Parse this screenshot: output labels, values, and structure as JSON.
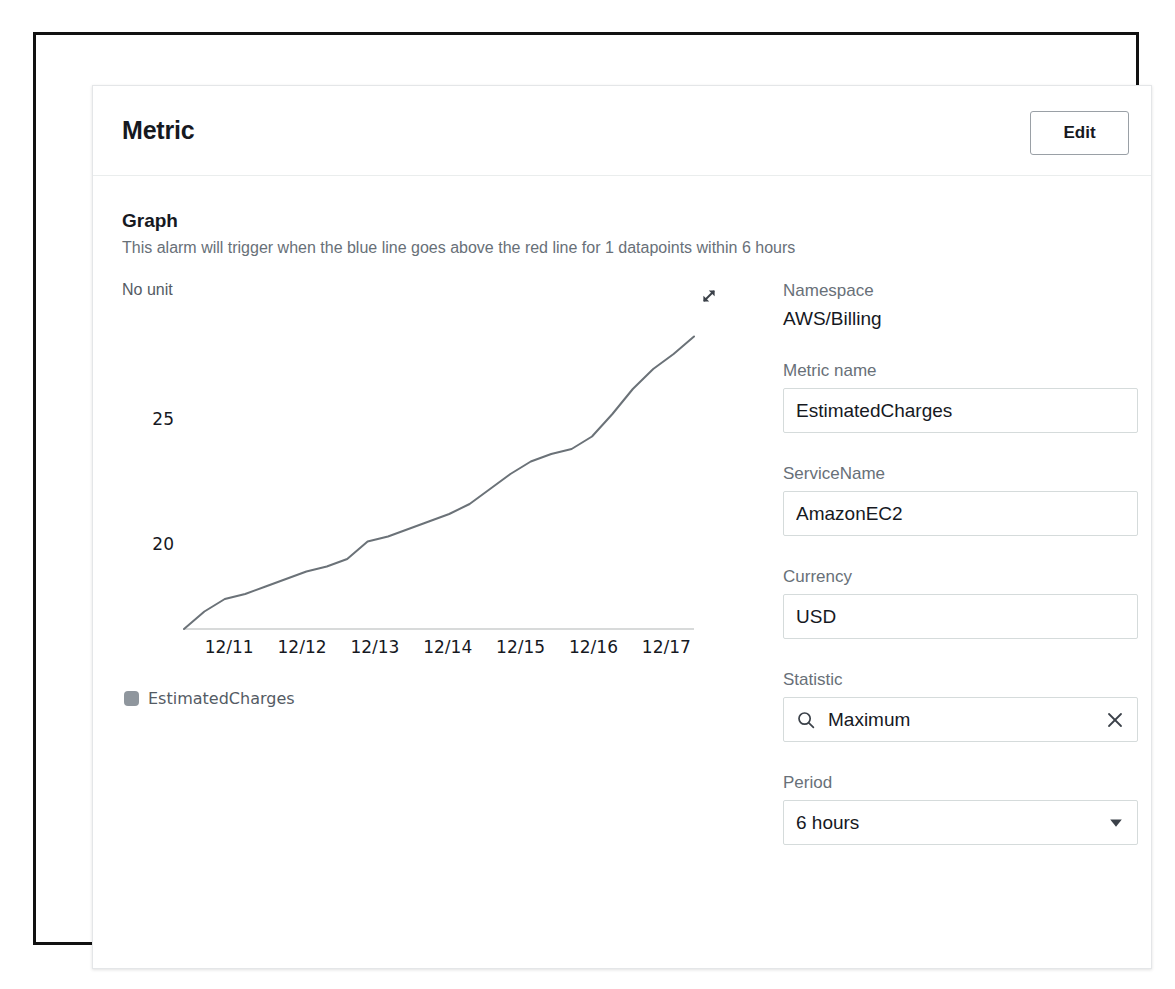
{
  "card": {
    "title": "Metric",
    "edit_label": "Edit"
  },
  "graph_section": {
    "heading": "Graph",
    "description": "This alarm will trigger when the blue line goes above the red line for 1 datapoints within 6 hours",
    "expand_icon": "expand-arrows-icon"
  },
  "chart_data": {
    "type": "line",
    "title": "",
    "unit_label": "No unit",
    "xlabel": "",
    "ylabel": "",
    "grid": false,
    "legend_position": "bottom-left",
    "categories": [
      "12/11",
      "12/12",
      "12/13",
      "12/14",
      "12/15",
      "12/16",
      "12/17"
    ],
    "tick_labels_y": [
      "20",
      "25"
    ],
    "ytick_values": [
      20,
      25
    ],
    "ylim": [
      16.6,
      29.4
    ],
    "series": [
      {
        "name": "EstimatedCharges",
        "color": "#6b7278",
        "x": [
          "12/10 18:00",
          "12/11 00:00",
          "12/11 06:00",
          "12/11 12:00",
          "12/11 18:00",
          "12/12 00:00",
          "12/12 06:00",
          "12/12 12:00",
          "12/12 18:00",
          "12/13 00:00",
          "12/13 06:00",
          "12/13 12:00",
          "12/13 18:00",
          "12/14 00:00",
          "12/14 06:00",
          "12/14 12:00",
          "12/14 18:00",
          "12/15 00:00",
          "12/15 06:00",
          "12/15 12:00",
          "12/15 18:00",
          "12/16 00:00",
          "12/16 06:00",
          "12/16 12:00",
          "12/16 18:00",
          "12/17 00:00"
        ],
        "values": [
          16.6,
          17.3,
          17.8,
          18.0,
          18.3,
          18.6,
          18.9,
          19.1,
          19.4,
          20.1,
          20.3,
          20.6,
          20.9,
          21.2,
          21.6,
          22.2,
          22.8,
          23.3,
          23.6,
          23.8,
          24.3,
          25.2,
          26.2,
          27.0,
          27.6,
          28.3
        ]
      }
    ]
  },
  "form": {
    "fields": [
      {
        "label": "Namespace",
        "value": "AWS/Billing",
        "kind": "static"
      },
      {
        "label": "Metric name",
        "value": "EstimatedCharges",
        "kind": "input"
      },
      {
        "label": "ServiceName",
        "value": "AmazonEC2",
        "kind": "input"
      },
      {
        "label": "Currency",
        "value": "USD",
        "kind": "input"
      },
      {
        "label": "Statistic",
        "value": "Maximum",
        "kind": "search",
        "search_icon": "search-icon",
        "clear_icon": "close-icon"
      },
      {
        "label": "Period",
        "value": "6 hours",
        "kind": "select",
        "caret_icon": "caret-down-icon"
      }
    ]
  },
  "colors": {
    "text_primary": "#16191f",
    "text_secondary": "#687078",
    "line": "#6b7278",
    "border": "#d5dbdb",
    "frame": "#111111"
  }
}
